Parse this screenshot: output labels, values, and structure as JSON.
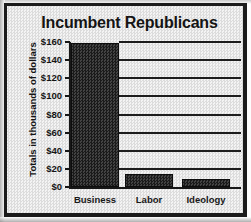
{
  "chart_data": {
    "type": "bar",
    "title": "Incumbent Republicans",
    "xlabel": "",
    "ylabel": "Totals in thousands of dollars",
    "categories": [
      "Business",
      "Labor",
      "Ideology"
    ],
    "values": [
      159,
      14,
      9
    ],
    "ylim": [
      0,
      160
    ],
    "ytick_labels": [
      "$0",
      "$20",
      "$40",
      "$60",
      "$80",
      "$100",
      "$120",
      "$140",
      "$160"
    ],
    "ytick_values": [
      0,
      20,
      40,
      60,
      80,
      100,
      120,
      140,
      160
    ],
    "grid": true,
    "legend": null,
    "series": [
      {
        "name": "Totals",
        "values": [
          159,
          14,
          9
        ]
      }
    ],
    "colors": {
      "bar": "#2b2b2b",
      "axis": "#171717",
      "grid": "#1d1d1d",
      "background": "#e9e9e9",
      "text": "#141414",
      "border": "#1b1b1b"
    }
  }
}
